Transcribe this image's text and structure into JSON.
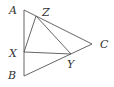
{
  "diagram": {
    "type": "geometry-triangle",
    "points": {
      "A": {
        "x": 24,
        "y": 10
      },
      "B": {
        "x": 24,
        "y": 76
      },
      "C": {
        "x": 92,
        "y": 44
      },
      "X": {
        "x": 24,
        "y": 52
      },
      "Y": {
        "x": 71,
        "y": 54
      },
      "Z": {
        "x": 36,
        "y": 16
      }
    },
    "segments": [
      [
        "A",
        "B"
      ],
      [
        "A",
        "C"
      ],
      [
        "B",
        "C"
      ],
      [
        "X",
        "Y"
      ],
      [
        "X",
        "Z"
      ],
      [
        "Z",
        "Y"
      ]
    ],
    "labels": {
      "A": {
        "text": "A",
        "x": 9,
        "y": 14
      },
      "Z": {
        "text": "Z",
        "x": 42,
        "y": 16
      },
      "C": {
        "text": "C",
        "x": 100,
        "y": 48
      },
      "X": {
        "text": "X",
        "x": 9,
        "y": 57
      },
      "Y": {
        "text": "Y",
        "x": 67,
        "y": 68
      },
      "B": {
        "text": "B",
        "x": 8,
        "y": 79
      }
    },
    "stroke_color": "#555555",
    "label_color": "#333333"
  }
}
